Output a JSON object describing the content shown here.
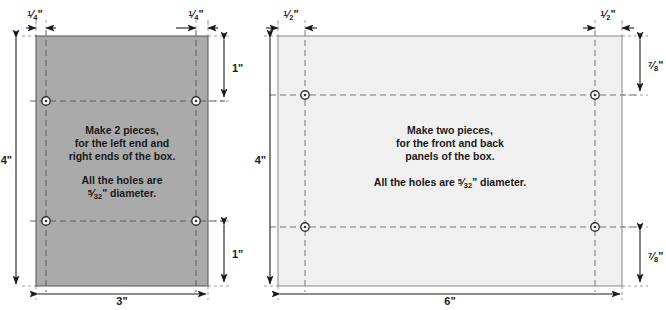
{
  "drawing": {
    "title": "Box panel cutting diagram",
    "background_color": "#ffffff",
    "line_color": "#1a1a1a",
    "panels": [
      {
        "id": "end-panel",
        "name": "left-end-panel",
        "fill_color": "#aaaaaa",
        "stroke_color": "#555555",
        "width_label": "3\"",
        "height_label": "4\"",
        "hole_inset_top_label": "1\"",
        "hole_inset_bottom_label": "1\"",
        "hole_inset_left_label": "1/4\"",
        "hole_inset_right_label": "1/4\"",
        "inset_left_num": "1",
        "inset_left_den": "4",
        "inset_right_num": "1",
        "inset_right_den": "4",
        "notes": [
          "Make 2 pieces,",
          "for the left end and",
          "right ends of the box."
        ],
        "hole_note_lines": [
          "All the holes are",
          "⁄\" diameter."
        ],
        "hole_note_line1": "All the holes are",
        "hole_note_frac_num": "5",
        "hole_note_frac_den": "32",
        "hole_note_suffix": "\" diameter.",
        "hole_count": 4
      },
      {
        "id": "front-panel",
        "name": "front-back-panel",
        "fill_color": "#f0f0f0",
        "stroke_color": "#888888",
        "width_label": "6\"",
        "height_label": "4\"",
        "hole_inset_top_label": "7/8\"",
        "hole_inset_bottom_label": "7/8\"",
        "hole_inset_left_label": "1/2\"",
        "hole_inset_right_label": "1/2\"",
        "inset_left_num": "1",
        "inset_left_den": "2",
        "inset_right_num": "1",
        "inset_right_den": "2",
        "inset_top_num": "7",
        "inset_top_den": "8",
        "inset_bottom_num": "7",
        "inset_bottom_den": "8",
        "notes": [
          "Make two pieces,",
          "for the front and back",
          "panels of the box."
        ],
        "hole_note_prefix": "All the holes are ",
        "hole_note_frac_num": "5",
        "hole_note_frac_den": "32",
        "hole_note_suffix": "\" diameter.",
        "hole_count": 4
      }
    ],
    "labels": {
      "left_width": "3\"",
      "left_height": "4\"",
      "left_top_right_inset": "1\"",
      "left_bottom_right_inset": "1\"",
      "right_width": "6\"",
      "right_height": "4\"",
      "inch_mark": "\""
    }
  }
}
